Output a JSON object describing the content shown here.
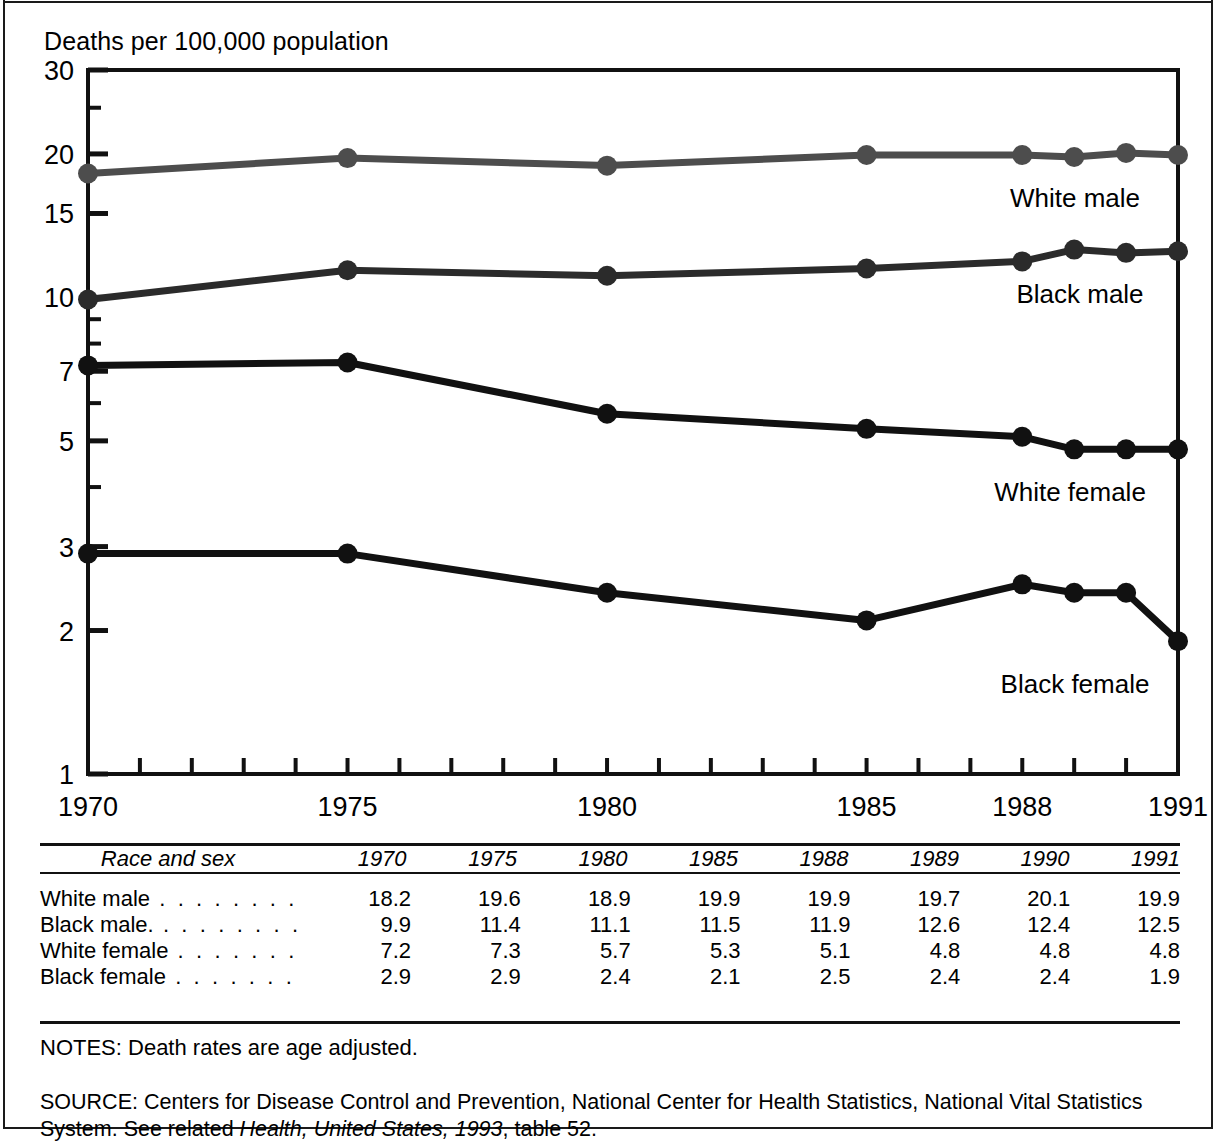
{
  "figure": {
    "y_axis_title": "Deaths per 100,000 population",
    "notes": "NOTES: Death rates are age adjusted.",
    "source_line1": "SOURCE: Centers for Disease Control and Prevention, National Center for Health Statistics, National Vital Statistics",
    "source_line2_prefix": "System. See related ",
    "source_line2_italic": "Health, United States, 1993",
    "source_line2_suffix": ", table 52."
  },
  "chart_data": {
    "type": "line",
    "title": "",
    "xlabel": "",
    "ylabel": "Deaths per 100,000 population",
    "yscale": "log",
    "ylim": [
      1,
      30
    ],
    "xlim": [
      1970,
      1991
    ],
    "grid": false,
    "legend_position": "inline-right",
    "x": [
      1970,
      1975,
      1980,
      1985,
      1988,
      1989,
      1990,
      1991
    ],
    "xticks_labeled": [
      "1970",
      "1975",
      "1980",
      "1985",
      "1988",
      "1991"
    ],
    "xticks_labeled_values": [
      1970,
      1975,
      1980,
      1985,
      1988,
      1991
    ],
    "yticks": [
      30,
      20,
      15,
      10,
      7,
      5,
      3,
      2,
      1
    ],
    "ytick_labels": [
      "30",
      "20",
      "15",
      "10",
      "7",
      "5",
      "3",
      "2",
      "1"
    ],
    "series": [
      {
        "name": "White male",
        "color": "#4d4d4d",
        "values": [
          18.2,
          19.6,
          18.9,
          19.9,
          19.9,
          19.7,
          20.1,
          19.9
        ]
      },
      {
        "name": "Black male",
        "color": "#2b2b2b",
        "values": [
          9.9,
          11.4,
          11.1,
          11.5,
          11.9,
          12.6,
          12.4,
          12.5
        ]
      },
      {
        "name": "White female",
        "color": "#111111",
        "values": [
          7.2,
          7.3,
          5.7,
          5.3,
          5.1,
          4.8,
          4.8,
          4.8
        ]
      },
      {
        "name": "Black female",
        "color": "#111111",
        "values": [
          2.9,
          2.9,
          2.4,
          2.1,
          2.5,
          2.4,
          2.4,
          1.9
        ]
      }
    ]
  },
  "table": {
    "columns": [
      "Race and sex",
      "1970",
      "1975",
      "1980",
      "1985",
      "1988",
      "1989",
      "1990",
      "1991"
    ],
    "rows": [
      {
        "label": "White male",
        "leader": ". . . . . . . .",
        "values": [
          "18.2",
          "19.6",
          "18.9",
          "19.9",
          "19.9",
          "19.7",
          "20.1",
          "19.9"
        ]
      },
      {
        "label": "Black male.",
        "leader": ". . . . . . . .",
        "values": [
          "9.9",
          "11.4",
          "11.1",
          "11.5",
          "11.9",
          "12.6",
          "12.4",
          "12.5"
        ]
      },
      {
        "label": "White female",
        "leader": ". . . . . . .",
        "values": [
          "7.2",
          "7.3",
          "5.7",
          "5.3",
          "5.1",
          "4.8",
          "4.8",
          "4.8"
        ]
      },
      {
        "label": "Black female",
        "leader": ". . . . . . .",
        "values": [
          "2.9",
          "2.9",
          "2.4",
          "2.1",
          "2.5",
          "2.4",
          "2.4",
          "1.9"
        ]
      }
    ]
  }
}
